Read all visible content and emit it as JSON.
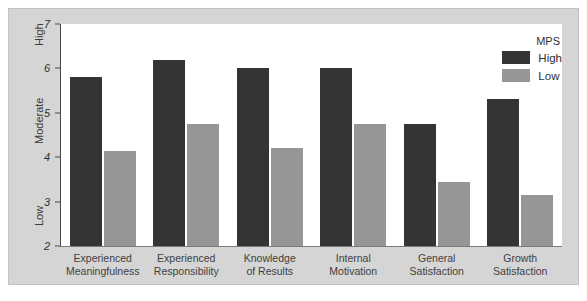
{
  "chart_data": {
    "type": "bar",
    "title": "",
    "xlabel": "",
    "ylabel": "",
    "ylim": [
      2,
      7
    ],
    "yticks": [
      2,
      3,
      4,
      5,
      6,
      7
    ],
    "grid": false,
    "legend_position": "top-right",
    "legend_title": "MPS",
    "axis_band_labels": [
      {
        "label": "High",
        "value": 6.5
      },
      {
        "label": "Moderate",
        "value": 4.3
      },
      {
        "label": "Low",
        "value": 2.45
      }
    ],
    "categories": [
      "Experienced Meaningfulness",
      "Experienced Responsibility",
      "Knowledge of Results",
      "Internal Motivation",
      "General Satisfaction",
      "Growth Satisfaction"
    ],
    "category_lines": [
      [
        "Experienced",
        "Meaningfulness"
      ],
      [
        "Experienced",
        "Responsibility"
      ],
      [
        "Knowledge",
        "of Results"
      ],
      [
        "Internal",
        "Motivation"
      ],
      [
        "General",
        "Satisfaction"
      ],
      [
        "Growth",
        "Satisfaction"
      ]
    ],
    "series": [
      {
        "name": "High",
        "color": "#343434",
        "values": [
          5.8,
          6.2,
          6.0,
          6.0,
          4.75,
          5.3
        ]
      },
      {
        "name": "Low",
        "color": "#969696",
        "values": [
          4.15,
          4.75,
          4.2,
          4.75,
          3.45,
          3.15
        ]
      }
    ]
  },
  "colors": {
    "figure_background": "#d5d5d5",
    "plot_background": "#ffffff",
    "axis": "#4a4a4a",
    "high_bar": "#343434",
    "low_bar": "#969696"
  }
}
